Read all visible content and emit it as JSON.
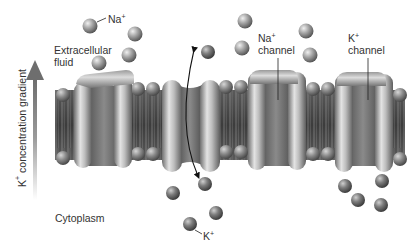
{
  "diagram": {
    "regions": {
      "top": "Extracellular fluid",
      "bottom": "Cytoplasm"
    },
    "labels": {
      "na_ion": {
        "base": "Na",
        "sup": "+"
      },
      "extracellular_line1": "Extracellular",
      "extracellular_line2": "fluid",
      "na_channel_line1": {
        "base": "Na",
        "sup": "+"
      },
      "na_channel_line2": "channel",
      "k_channel_line1": {
        "base": "K",
        "sup": "+"
      },
      "k_channel_line2": "channel",
      "cytoplasm": "Cytoplasm",
      "k_ion": {
        "base": "K",
        "sup": "+"
      },
      "gradient": {
        "base": "K",
        "sup": "+",
        "rest": " concentration gradient"
      }
    },
    "channels": [
      {
        "name": "left-channel",
        "x": 75,
        "w": 62
      },
      {
        "name": "center-open-channel",
        "x": 162,
        "w": 58
      },
      {
        "name": "na-channel",
        "x": 248,
        "w": 58
      },
      {
        "name": "k-channel",
        "x": 335,
        "w": 58
      }
    ],
    "ions_extracellular": [
      [
        88,
        22
      ],
      [
        135,
        34
      ],
      [
        100,
        63
      ],
      [
        128,
        55
      ],
      [
        208,
        52
      ],
      [
        245,
        22
      ],
      [
        242,
        48
      ],
      [
        305,
        31
      ],
      [
        310,
        55
      ]
    ],
    "ions_cytoplasm": [
      [
        172,
        192
      ],
      [
        205,
        183
      ],
      [
        215,
        214
      ],
      [
        187,
        226
      ],
      [
        345,
        186
      ],
      [
        378,
        181
      ],
      [
        357,
        200
      ],
      [
        382,
        205
      ]
    ],
    "colors": {
      "membrane_dark": "#4a4a4a",
      "protein_light": "#d0d0d0",
      "protein_dark": "#6a6a6a",
      "ion": "#9a9a9a",
      "text": "#333333",
      "arrow": "#7a7a7a"
    }
  }
}
